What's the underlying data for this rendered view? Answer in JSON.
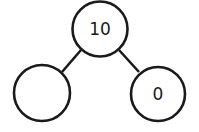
{
  "diagram": {
    "type": "number-bond",
    "whole": {
      "value": "10"
    },
    "parts": [
      {
        "value": ""
      },
      {
        "value": "0"
      }
    ],
    "stroke_color": "#1a1a1a",
    "background": "#ffffff"
  }
}
